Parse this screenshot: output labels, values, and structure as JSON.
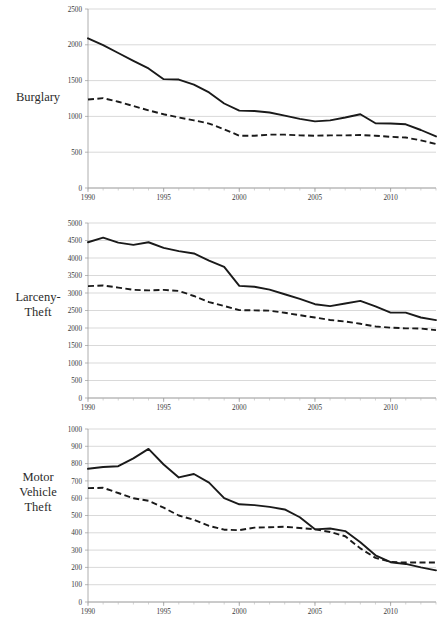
{
  "figure": {
    "panel_labels": {
      "burglary": "Burglary",
      "larceny_theft_line1": "Larceny-",
      "larceny_theft_line2": "Theft",
      "motor_vehicle_theft_line1": "Motor",
      "motor_vehicle_theft_line2": "Vehicle",
      "motor_vehicle_theft_line3": "Theft"
    },
    "colors": {
      "series_line": "#1a1a1a",
      "gridline": "#c9c9c9",
      "axis": "#9a9a9a",
      "text": "#2b2b2b",
      "background": "#ffffff"
    }
  },
  "chart_data": [
    {
      "type": "line",
      "title": "Burglary",
      "xlabel": "",
      "ylabel": "",
      "xlim": [
        1990,
        2013
      ],
      "ylim": [
        0,
        2500
      ],
      "ytick_values": [
        0,
        500,
        1000,
        1500,
        2000,
        2500
      ],
      "ytick_labels": [
        "0",
        "500",
        "1000",
        "1500",
        "2000",
        "2500"
      ],
      "xtick_values": [
        1990,
        1995,
        2000,
        2005,
        2010
      ],
      "xtick_labels": [
        "1990",
        "1995",
        "2000",
        "2005",
        "2010"
      ],
      "grid": true,
      "legend_position": "none",
      "x": [
        1990,
        1991,
        1992,
        1993,
        1994,
        1995,
        1996,
        1997,
        1998,
        1999,
        2000,
        2001,
        2002,
        2003,
        2004,
        2005,
        2006,
        2007,
        2008,
        2009,
        2010,
        2011,
        2012,
        2013
      ],
      "series": [
        {
          "name": "solid-series",
          "style": "solid",
          "values": [
            2090,
            1995,
            1885,
            1775,
            1670,
            1520,
            1515,
            1445,
            1335,
            1180,
            1080,
            1075,
            1055,
            1010,
            965,
            930,
            945,
            985,
            1030,
            905,
            900,
            890,
            810,
            720
          ]
        },
        {
          "name": "dashed-series",
          "style": "dashed",
          "values": [
            1235,
            1255,
            1205,
            1145,
            1085,
            1030,
            985,
            945,
            900,
            820,
            730,
            730,
            745,
            745,
            735,
            730,
            735,
            735,
            740,
            730,
            715,
            705,
            665,
            615
          ]
        }
      ]
    },
    {
      "type": "line",
      "title": "Larceny-Theft",
      "xlabel": "",
      "ylabel": "",
      "xlim": [
        1990,
        2013
      ],
      "ylim": [
        0,
        5000
      ],
      "ytick_values": [
        0,
        500,
        1000,
        1500,
        2000,
        2500,
        3000,
        3500,
        4000,
        4500,
        5000
      ],
      "ytick_labels": [
        "0",
        "500",
        "1000",
        "1500",
        "2000",
        "2500",
        "3000",
        "3500",
        "4000",
        "4500",
        "5000"
      ],
      "xtick_values": [
        1990,
        1995,
        2000,
        2005,
        2010
      ],
      "xtick_labels": [
        "1990",
        "1995",
        "2000",
        "2005",
        "2010"
      ],
      "grid": true,
      "legend_position": "none",
      "x": [
        1990,
        1991,
        1992,
        1993,
        1994,
        1995,
        1996,
        1997,
        1998,
        1999,
        2000,
        2001,
        2002,
        2003,
        2004,
        2005,
        2006,
        2007,
        2008,
        2009,
        2010,
        2011,
        2012,
        2013
      ],
      "series": [
        {
          "name": "solid-series",
          "style": "solid",
          "values": [
            4450,
            4580,
            4440,
            4375,
            4450,
            4290,
            4195,
            4130,
            3925,
            3745,
            3205,
            3180,
            3095,
            2965,
            2830,
            2680,
            2625,
            2700,
            2775,
            2620,
            2440,
            2440,
            2300,
            2225
          ]
        },
        {
          "name": "dashed-series",
          "style": "dashed",
          "values": [
            3195,
            3215,
            3155,
            3090,
            3075,
            3090,
            3060,
            2915,
            2740,
            2630,
            2510,
            2505,
            2495,
            2435,
            2365,
            2300,
            2230,
            2185,
            2120,
            2045,
            2010,
            1990,
            1985,
            1940
          ]
        }
      ]
    },
    {
      "type": "line",
      "title": "Motor Vehicle Theft",
      "xlabel": "",
      "ylabel": "",
      "xlim": [
        1990,
        2013
      ],
      "ylim": [
        0,
        1000
      ],
      "ytick_values": [
        0,
        100,
        200,
        300,
        400,
        500,
        600,
        700,
        800,
        900,
        1000
      ],
      "ytick_labels": [
        "0",
        "100",
        "200",
        "300",
        "400",
        "500",
        "600",
        "700",
        "800",
        "900",
        "1000"
      ],
      "xtick_values": [
        1990,
        1995,
        2000,
        2005,
        2010
      ],
      "xtick_labels": [
        "1990",
        "1995",
        "2000",
        "2005",
        "2010"
      ],
      "grid": true,
      "legend_position": "none",
      "x": [
        1990,
        1991,
        1992,
        1993,
        1994,
        1995,
        1996,
        1997,
        1998,
        1999,
        2000,
        2001,
        2002,
        2003,
        2004,
        2005,
        2006,
        2007,
        2008,
        2009,
        2010,
        2011,
        2012,
        2013
      ],
      "series": [
        {
          "name": "solid-series",
          "style": "solid",
          "values": [
            770,
            780,
            785,
            830,
            885,
            795,
            720,
            740,
            690,
            600,
            565,
            560,
            550,
            535,
            490,
            420,
            425,
            410,
            345,
            270,
            230,
            220,
            200,
            183
          ]
        },
        {
          "name": "dashed-series",
          "style": "dashed",
          "values": [
            658,
            660,
            630,
            600,
            585,
            545,
            500,
            475,
            440,
            418,
            415,
            430,
            432,
            435,
            428,
            420,
            405,
            380,
            310,
            255,
            232,
            228,
            228,
            228
          ]
        }
      ]
    }
  ]
}
